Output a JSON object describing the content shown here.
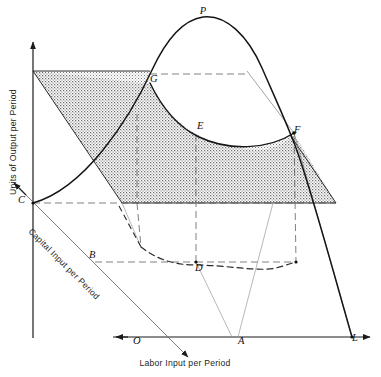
{
  "figure": {
    "type": "diagram",
    "background_color": "#ffffff",
    "ink_color": "#1b1b1b",
    "shade_color": "#8d8d8d"
  },
  "axes": {
    "vertical": {
      "label": "Units of Output per Period",
      "orientation": "vertical-up",
      "arrow": true
    },
    "horizontal": {
      "label": "Labor Input per Period",
      "orientation": "horizontal-right",
      "arrow": true
    },
    "depth": {
      "label": "Capital Input per Period",
      "orientation": "diagonal-down-right",
      "arrow": true
    }
  },
  "points": [
    {
      "id": "P",
      "label": "P",
      "x": 203,
      "y": 14,
      "note": "apex of total product curve"
    },
    {
      "id": "G",
      "label": "G",
      "x": 150,
      "y": 82,
      "note": "intersection of curve with plane, left"
    },
    {
      "id": "E",
      "label": "E",
      "x": 197,
      "y": 129,
      "note": "point on plane edge"
    },
    {
      "id": "F",
      "label": "F",
      "x": 294,
      "y": 133,
      "note": "intersection of curve with plane, right"
    },
    {
      "id": "C",
      "label": "C",
      "x": 18,
      "y": 203,
      "note": "origin of output axis on plane"
    },
    {
      "id": "B",
      "label": "B",
      "x": 89,
      "y": 258,
      "note": "capital axis reference"
    },
    {
      "id": "D",
      "label": "D",
      "x": 195,
      "y": 271,
      "note": "base plane point below E"
    },
    {
      "id": "O",
      "label": "O",
      "x": 133,
      "y": 344,
      "note": "origin on labor axis"
    },
    {
      "id": "A",
      "label": "A",
      "x": 238,
      "y": 344,
      "note": "labor quantity reference"
    },
    {
      "id": "L",
      "label": "L",
      "x": 352,
      "y": 341,
      "note": "terminal labor input"
    }
  ],
  "curves": [
    {
      "name": "total-product-curve",
      "style": "solid",
      "description": "rises from C, peaks at P, falls to L"
    },
    {
      "name": "plane-cut-curve",
      "style": "solid",
      "description": "U-shaped intersection curve from G through E to F"
    },
    {
      "name": "base-projection-curve",
      "style": "dashed",
      "description": "U-shaped projection in base plane through D"
    }
  ],
  "plane": {
    "name": "output-plane",
    "fill": "stipple-gray",
    "description": "tilted quadrilateral plane cutting the production surface"
  }
}
